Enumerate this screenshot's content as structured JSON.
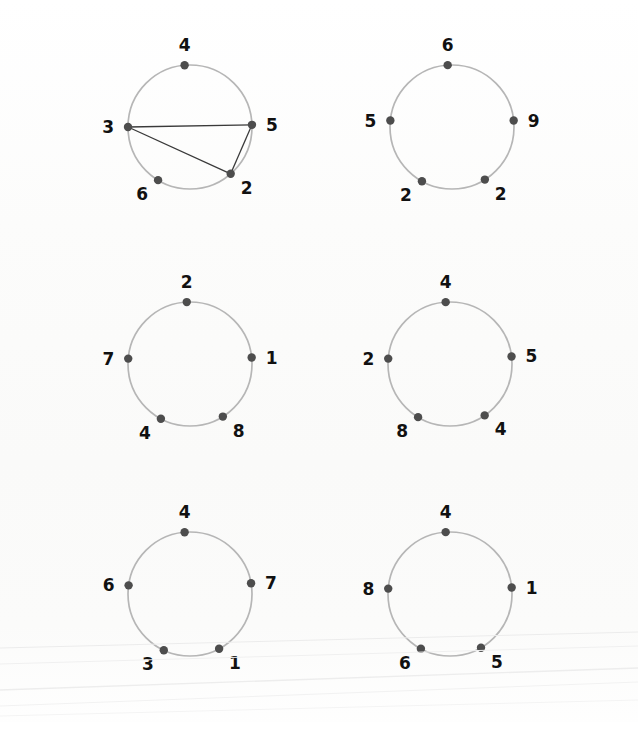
{
  "figure": {
    "background_color": "#fdfdfc",
    "circle_stroke_color": "#b6b6b6",
    "node_fill_color": "#4d4d4d",
    "chord_stroke_color": "#3a3a3a",
    "label_color": "#111111",
    "width": 638,
    "height": 744,
    "columns": 2,
    "rows": 3
  },
  "chart_data": {
    "type": "diagram",
    "title": "",
    "xlabel": "",
    "ylabel": "",
    "panels": [
      {
        "id": "panel-1",
        "center": [
          190,
          127
        ],
        "radius": 62,
        "nodes": [
          {
            "label": "4",
            "angle": 95,
            "label_pos": "top"
          },
          {
            "label": "5",
            "angle": 2,
            "label_pos": "right"
          },
          {
            "label": "2",
            "angle": -49,
            "label_pos": "bottom-right"
          },
          {
            "label": "6",
            "angle": -121,
            "label_pos": "bottom-left"
          },
          {
            "label": "3",
            "angle": 180,
            "label_pos": "left"
          }
        ],
        "edges": [
          {
            "from": "3",
            "to": "5"
          },
          {
            "from": "3",
            "to": "2"
          },
          {
            "from": "5",
            "to": "2"
          }
        ]
      },
      {
        "id": "panel-2",
        "center": [
          452,
          127
        ],
        "radius": 62,
        "nodes": [
          {
            "label": "6",
            "angle": 94,
            "label_pos": "top"
          },
          {
            "label": "9",
            "angle": 6,
            "label_pos": "right"
          },
          {
            "label": "2",
            "angle": -58,
            "label_pos": "bottom-right"
          },
          {
            "label": "2",
            "angle": -119,
            "label_pos": "bottom-left"
          },
          {
            "label": "5",
            "angle": 174,
            "label_pos": "left"
          }
        ],
        "edges": []
      },
      {
        "id": "panel-3",
        "center": [
          190,
          364
        ],
        "radius": 62,
        "nodes": [
          {
            "label": "2",
            "angle": 93,
            "label_pos": "top"
          },
          {
            "label": "1",
            "angle": 6,
            "label_pos": "right"
          },
          {
            "label": "8",
            "angle": -58,
            "label_pos": "bottom-right"
          },
          {
            "label": "4",
            "angle": -118,
            "label_pos": "bottom-left"
          },
          {
            "label": "7",
            "angle": 175,
            "label_pos": "left"
          }
        ],
        "edges": []
      },
      {
        "id": "panel-4",
        "center": [
          450,
          364
        ],
        "radius": 62,
        "nodes": [
          {
            "label": "4",
            "angle": 94,
            "label_pos": "top"
          },
          {
            "label": "5",
            "angle": 7,
            "label_pos": "right"
          },
          {
            "label": "4",
            "angle": -56,
            "label_pos": "bottom-right"
          },
          {
            "label": "8",
            "angle": -121,
            "label_pos": "bottom-left"
          },
          {
            "label": "2",
            "angle": 175,
            "label_pos": "left"
          }
        ],
        "edges": []
      },
      {
        "id": "panel-5",
        "center": [
          190,
          594
        ],
        "radius": 62,
        "nodes": [
          {
            "label": "4",
            "angle": 95,
            "label_pos": "top"
          },
          {
            "label": "7",
            "angle": 10,
            "label_pos": "right"
          },
          {
            "label": "1",
            "angle": -62,
            "label_pos": "bottom-right"
          },
          {
            "label": "3",
            "angle": -115,
            "label_pos": "bottom-left"
          },
          {
            "label": "6",
            "angle": 172,
            "label_pos": "left"
          }
        ],
        "edges": []
      },
      {
        "id": "panel-6",
        "center": [
          450,
          594
        ],
        "radius": 62,
        "nodes": [
          {
            "label": "4",
            "angle": 94,
            "label_pos": "top"
          },
          {
            "label": "1",
            "angle": 6,
            "label_pos": "right"
          },
          {
            "label": "5",
            "angle": -60,
            "label_pos": "bottom-right"
          },
          {
            "label": "6",
            "angle": -118,
            "label_pos": "bottom-left"
          },
          {
            "label": "8",
            "angle": 175,
            "label_pos": "left"
          }
        ],
        "edges": []
      }
    ]
  }
}
